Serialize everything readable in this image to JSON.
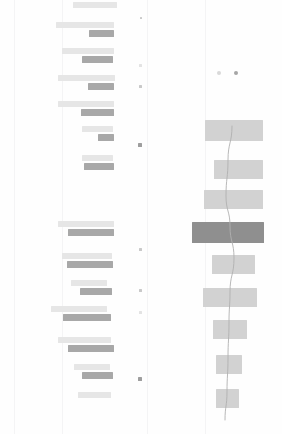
{
  "view": {
    "title": "",
    "background": "#fefefe",
    "width": 282,
    "height": 434
  },
  "palette": {
    "label_bar": "#e6e6e6",
    "value_bar": "#a8a8a8",
    "right_bar": "#d2d2d2",
    "right_bar_highlight": "#8f8f8f",
    "trend_line": "#b0b0b0",
    "rule": "#f4f4f5",
    "tick_faint": "#e3e3e3",
    "tick_mid": "#c9c9c9",
    "tick_strong": "#9e9e9e"
  },
  "rules": [
    {
      "name": "left-edge-rule",
      "x": 14,
      "y": 0,
      "height": 434
    },
    {
      "name": "left-inner-rule",
      "x": 62,
      "y": 0,
      "height": 434
    },
    {
      "name": "center-rule",
      "x": 147,
      "y": 0,
      "height": 434
    },
    {
      "name": "right-rule",
      "x": 205,
      "y": 0,
      "height": 434
    }
  ],
  "left_panel": {
    "name": "left-bar-groups",
    "right_align_x": 117,
    "groups": [
      {
        "name": "group-upper",
        "rows": [
          {
            "label_w": 44,
            "label_x": 73,
            "label_y": 2,
            "label_h": 6,
            "value_w": 0,
            "value_x": 0,
            "value_y": 0,
            "value_h": 0
          },
          {
            "label_w": 58,
            "label_x": 56,
            "label_y": 22,
            "label_h": 6,
            "value_w": 25,
            "value_x": 89,
            "value_y": 30,
            "value_h": 7
          },
          {
            "label_w": 52,
            "label_x": 62,
            "label_y": 48,
            "label_h": 6,
            "value_w": 31,
            "value_x": 82,
            "value_y": 56,
            "value_h": 7
          },
          {
            "label_w": 57,
            "label_x": 58,
            "label_y": 75,
            "label_h": 6,
            "value_w": 26,
            "value_x": 88,
            "value_y": 83,
            "value_h": 7
          },
          {
            "label_w": 56,
            "label_x": 58,
            "label_y": 101,
            "label_h": 6,
            "value_w": 33,
            "value_x": 81,
            "value_y": 109,
            "value_h": 7
          },
          {
            "label_w": 31,
            "label_x": 82,
            "label_y": 126,
            "label_h": 6,
            "value_w": 16,
            "value_x": 98,
            "value_y": 134,
            "value_h": 7
          },
          {
            "label_w": 31,
            "label_x": 82,
            "label_y": 155,
            "label_h": 6,
            "value_w": 30,
            "value_x": 84,
            "value_y": 163,
            "value_h": 7
          }
        ]
      },
      {
        "name": "group-lower",
        "rows": [
          {
            "label_w": 56,
            "label_x": 58,
            "label_y": 221,
            "label_h": 6,
            "value_w": 46,
            "value_x": 68,
            "value_y": 229,
            "value_h": 7
          },
          {
            "label_w": 50,
            "label_x": 62,
            "label_y": 253,
            "label_h": 6,
            "value_w": 46,
            "value_x": 67,
            "value_y": 261,
            "value_h": 7
          },
          {
            "label_w": 36,
            "label_x": 71,
            "label_y": 280,
            "label_h": 6,
            "value_w": 32,
            "value_x": 80,
            "value_y": 288,
            "value_h": 7
          },
          {
            "label_w": 56,
            "label_x": 51,
            "label_y": 306,
            "label_h": 6,
            "value_w": 48,
            "value_x": 63,
            "value_y": 314,
            "value_h": 7
          },
          {
            "label_w": 53,
            "label_x": 58,
            "label_y": 337,
            "label_h": 6,
            "value_w": 46,
            "value_x": 68,
            "value_y": 345,
            "value_h": 7
          },
          {
            "label_w": 36,
            "label_x": 74,
            "label_y": 364,
            "label_h": 6,
            "value_w": 31,
            "value_x": 82,
            "value_y": 372,
            "value_h": 7
          },
          {
            "label_w": 33,
            "label_x": 78,
            "label_y": 392,
            "label_h": 6,
            "value_w": 0,
            "value_x": 0,
            "value_y": 0,
            "value_h": 0
          }
        ]
      }
    ]
  },
  "tick_column": {
    "name": "value-tick-column",
    "marks": [
      {
        "x": 8,
        "y": 17,
        "w": 2,
        "h": 2,
        "tone": "tick_mid"
      },
      {
        "x": 7,
        "y": 64,
        "w": 3,
        "h": 3,
        "tone": "tick_faint"
      },
      {
        "x": 7,
        "y": 85,
        "w": 3,
        "h": 3,
        "tone": "tick_mid"
      },
      {
        "x": 6,
        "y": 143,
        "w": 4,
        "h": 4,
        "tone": "tick_strong"
      },
      {
        "x": 7,
        "y": 248,
        "w": 3,
        "h": 3,
        "tone": "tick_mid"
      },
      {
        "x": 7,
        "y": 289,
        "w": 3,
        "h": 3,
        "tone": "tick_mid"
      },
      {
        "x": 7,
        "y": 311,
        "w": 3,
        "h": 3,
        "tone": "tick_faint"
      },
      {
        "x": 6,
        "y": 377,
        "w": 4,
        "h": 4,
        "tone": "tick_strong"
      }
    ]
  },
  "right_panel": {
    "name": "right-chart-panel",
    "legend": [
      {
        "name": "legend-dot-series-a",
        "x": 63,
        "y": 71,
        "tone": "a"
      },
      {
        "name": "legend-dot-series-b",
        "x": 80,
        "y": 71,
        "tone": "b"
      }
    ],
    "bars": [
      {
        "x": 51,
        "y": 120,
        "w": 58,
        "h": 21,
        "highlight": false
      },
      {
        "x": 60,
        "y": 160,
        "w": 49,
        "h": 19,
        "highlight": false
      },
      {
        "x": 50,
        "y": 190,
        "w": 59,
        "h": 19,
        "highlight": false
      },
      {
        "x": 38,
        "y": 222,
        "w": 72,
        "h": 21,
        "highlight": true
      },
      {
        "x": 58,
        "y": 255,
        "w": 43,
        "h": 19,
        "highlight": false
      },
      {
        "x": 49,
        "y": 288,
        "w": 54,
        "h": 19,
        "highlight": false
      },
      {
        "x": 59,
        "y": 320,
        "w": 34,
        "h": 19,
        "highlight": false
      },
      {
        "x": 62,
        "y": 355,
        "w": 26,
        "h": 19,
        "highlight": false
      },
      {
        "x": 62,
        "y": 389,
        "w": 23,
        "h": 19,
        "highlight": false
      }
    ],
    "trend_line": {
      "name": "trend-line",
      "color": "#b0b0b0",
      "width": 0.9,
      "points": [
        {
          "x": 78,
          "y": 126
        },
        {
          "x": 74,
          "y": 160
        },
        {
          "x": 72,
          "y": 196
        },
        {
          "x": 76,
          "y": 226
        },
        {
          "x": 80,
          "y": 258
        },
        {
          "x": 76,
          "y": 292
        },
        {
          "x": 75,
          "y": 322
        },
        {
          "x": 74,
          "y": 358
        },
        {
          "x": 73,
          "y": 392
        },
        {
          "x": 71,
          "y": 420
        }
      ]
    }
  }
}
